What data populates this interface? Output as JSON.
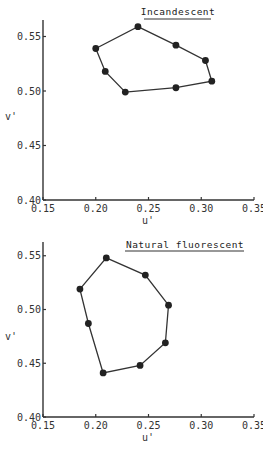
{
  "chart_data": [
    {
      "type": "scatter",
      "title": "Incandescent",
      "xlabel": "u'",
      "ylabel": "v'",
      "xlim": [
        0.15,
        0.35
      ],
      "ylim": [
        0.4,
        0.57
      ],
      "x_ticks": [
        "0.15",
        "0.20",
        "0.25",
        "0.30",
        "0.35"
      ],
      "y_ticks": [
        "0.40",
        "0.45",
        "0.50",
        "0.55"
      ],
      "grid": false,
      "connected": "closed-polygon",
      "points": [
        {
          "u": 0.24,
          "v": 0.559
        },
        {
          "u": 0.276,
          "v": 0.542
        },
        {
          "u": 0.304,
          "v": 0.528
        },
        {
          "u": 0.31,
          "v": 0.509
        },
        {
          "u": 0.276,
          "v": 0.503
        },
        {
          "u": 0.228,
          "v": 0.499
        },
        {
          "u": 0.209,
          "v": 0.518
        },
        {
          "u": 0.2,
          "v": 0.539
        }
      ]
    },
    {
      "type": "scatter",
      "title": "Natural fluorescent",
      "xlabel": "u'",
      "ylabel": "v'",
      "xlim": [
        0.15,
        0.35
      ],
      "ylim": [
        0.4,
        0.56
      ],
      "x_ticks": [
        "0.15",
        "0.20",
        "0.25",
        "0.30",
        "0.35"
      ],
      "y_ticks": [
        "0.40",
        "0.45",
        "0.50",
        "0.55"
      ],
      "grid": false,
      "connected": "closed-polygon",
      "points": [
        {
          "u": 0.21,
          "v": 0.548
        },
        {
          "u": 0.247,
          "v": 0.532
        },
        {
          "u": 0.269,
          "v": 0.504
        },
        {
          "u": 0.266,
          "v": 0.469
        },
        {
          "u": 0.242,
          "v": 0.448
        },
        {
          "u": 0.207,
          "v": 0.441
        },
        {
          "u": 0.193,
          "v": 0.487
        },
        {
          "u": 0.185,
          "v": 0.519
        }
      ]
    }
  ]
}
